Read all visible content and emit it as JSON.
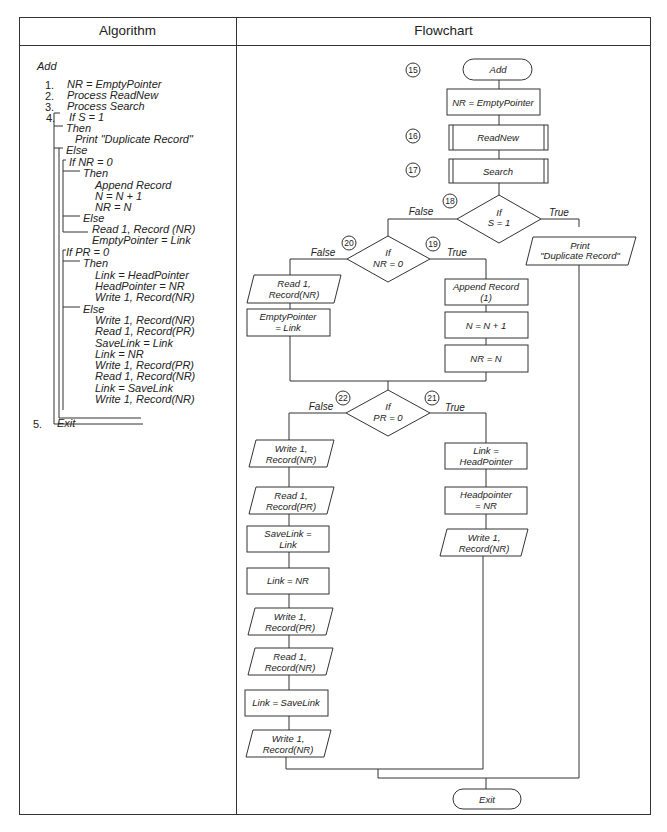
{
  "headers": {
    "algorithm": "Algorithm",
    "flowchart": "Flowchart"
  },
  "algorithm": {
    "title": "Add",
    "lines": [
      {
        "num": "1.",
        "text": "NR = EmptyPointer",
        "x": 67,
        "y": 79
      },
      {
        "num": "2.",
        "text": "Process ReadNew",
        "x": 67,
        "y": 90
      },
      {
        "num": "3.",
        "text": "Process Search",
        "x": 67,
        "y": 101
      },
      {
        "num": "4.",
        "text": "If S = 1",
        "x": 69,
        "y": 112
      },
      {
        "text": "Then",
        "x": 66,
        "y": 123
      },
      {
        "text": "Print \"Duplicate Record\"",
        "x": 75,
        "y": 134
      },
      {
        "text": "Else",
        "x": 66,
        "y": 145
      },
      {
        "text": "If NR = 0",
        "x": 69,
        "y": 157
      },
      {
        "text": "Then",
        "x": 83,
        "y": 168
      },
      {
        "text": "Append Record",
        "x": 95,
        "y": 180
      },
      {
        "text": "N = N + 1",
        "x": 95,
        "y": 191
      },
      {
        "text": "NR = N",
        "x": 95,
        "y": 202
      },
      {
        "text": "Else",
        "x": 83,
        "y": 213
      },
      {
        "text": "Read 1, Record (NR)",
        "x": 92,
        "y": 224
      },
      {
        "text": "EmptyPointer = Link",
        "x": 92,
        "y": 235
      },
      {
        "text": "If PR = 0",
        "x": 66,
        "y": 247
      },
      {
        "text": "Then",
        "x": 83,
        "y": 258
      },
      {
        "text": "Link = HeadPointer",
        "x": 95,
        "y": 270
      },
      {
        "text": "HeadPointer = NR",
        "x": 95,
        "y": 281
      },
      {
        "text": "Write 1,  Record(NR)",
        "x": 95,
        "y": 292
      },
      {
        "text": "Else",
        "x": 83,
        "y": 304
      },
      {
        "text": "Write 1,  Record(NR)",
        "x": 95,
        "y": 315
      },
      {
        "text": "Read 1,  Record(PR)",
        "x": 95,
        "y": 326
      },
      {
        "text": "SaveLink = Link",
        "x": 95,
        "y": 338
      },
      {
        "text": "Link = NR",
        "x": 95,
        "y": 349
      },
      {
        "text": "Write 1,  Record(PR)",
        "x": 95,
        "y": 360
      },
      {
        "text": "Read 1,  Record(NR)",
        "x": 95,
        "y": 371
      },
      {
        "text": "Link = SaveLink",
        "x": 95,
        "y": 383
      },
      {
        "text": "Write 1,  Record(NR)",
        "x": 95,
        "y": 394
      }
    ],
    "exit_num": "5.",
    "exit_text": "Exit"
  },
  "flowchart": {
    "nodes": {
      "add": "Add",
      "nr_empty": "NR = EmptyPointer",
      "readnew": "ReadNew",
      "search": "Search",
      "if_s_1": "If",
      "if_s_2": "S = 1",
      "print_1": "Print",
      "print_2": "\"Duplicate Record\"",
      "if_nr_1": "If",
      "if_nr_2": "NR = 0",
      "read_nr_1": "Read 1,",
      "read_nr_2": "Record(NR)",
      "emptyptr_1": "EmptyPointer",
      "emptyptr_2": "= Link",
      "append_1": "Append Record",
      "append_2": "(1)",
      "n_inc": "N = N + 1",
      "nr_n": "NR = N",
      "if_pr_1": "If",
      "if_pr_2": "PR = 0",
      "write_nr_a1": "Write 1,",
      "write_nr_a2": "Record(NR)",
      "read_pr_1": "Read 1,",
      "read_pr_2": "Record(PR)",
      "savelink_1": "SaveLink =",
      "savelink_2": "Link",
      "link_nr": "Link = NR",
      "write_pr_1": "Write 1,",
      "write_pr_2": "Record(PR)",
      "read_nr_b1": "Read 1,",
      "read_nr_b2": "Record(NR)",
      "link_savelink": "Link = SaveLink",
      "write_nr_b1": "Write 1,",
      "write_nr_b2": "Record(NR)",
      "link_head_1": "Link =",
      "link_head_2": "HeadPointer",
      "headptr_1": "Headpointer",
      "headptr_2": "= NR",
      "write_nr_c1": "Write 1,",
      "write_nr_c2": "Record(NR)",
      "exit": "Exit"
    },
    "labels": {
      "false": "False",
      "true": "True"
    },
    "step_numbers": {
      "n15": "15",
      "n16": "16",
      "n17": "17",
      "n18": "18",
      "n19": "19",
      "n20": "20",
      "n21": "21",
      "n22": "22"
    }
  }
}
